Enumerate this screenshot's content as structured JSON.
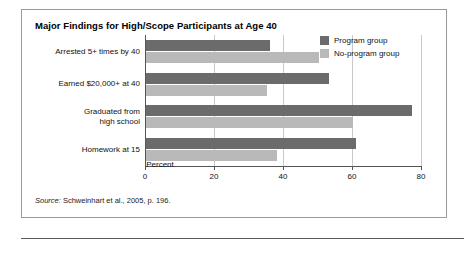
{
  "figure": {
    "title": "Major Findings for High/Scope Participants at Age 40",
    "source_prefix": "Source:",
    "source_text": " Schweinhart et al., 2005, p. 196."
  },
  "legend": {
    "position": "top-right",
    "items": [
      {
        "label": "Program group",
        "color": "#6b6b6b"
      },
      {
        "label": "No-program group",
        "color": "#b9b9b9"
      }
    ]
  },
  "chart_data": {
    "type": "bar",
    "orientation": "horizontal",
    "title": "Major Findings for High/Scope Participants at Age 40",
    "xlabel": "Percent",
    "ylabel": "",
    "xlim": [
      0,
      80
    ],
    "xticks": [
      0,
      20,
      40,
      60,
      80
    ],
    "xticklabels": [
      "0",
      "20",
      "40",
      "60",
      "80"
    ],
    "grid": true,
    "categories": [
      "Arrested 5+ times by 40",
      "Earned $20,000+ at 40",
      "Graduated from high school",
      "Homework at 15"
    ],
    "category_lines": [
      [
        "Arrested 5+ times by 40"
      ],
      [
        "Earned $20,000+ at 40"
      ],
      [
        "Graduated from",
        "high school"
      ],
      [
        "Homework at 15"
      ]
    ],
    "series": [
      {
        "name": "Program group",
        "color": "#6b6b6b",
        "values": [
          36,
          53,
          77,
          61
        ]
      },
      {
        "name": "No-program group",
        "color": "#b9b9b9",
        "values": [
          50,
          35,
          60,
          38
        ]
      }
    ]
  }
}
